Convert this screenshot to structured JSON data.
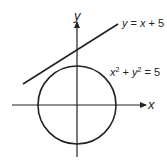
{
  "diagram": {
    "axes": {
      "x_label": "x",
      "y_label": "y"
    },
    "curves": [
      {
        "type": "line",
        "equation_text": "y = x + 5",
        "lhs": "y",
        "rhs_var": "x",
        "rhs_const": "+ 5"
      },
      {
        "type": "circle",
        "equation_text": "x² + y² = 5",
        "const": "= 5"
      }
    ],
    "colors": {
      "stroke": "#222222",
      "background": "#ffffff"
    }
  }
}
